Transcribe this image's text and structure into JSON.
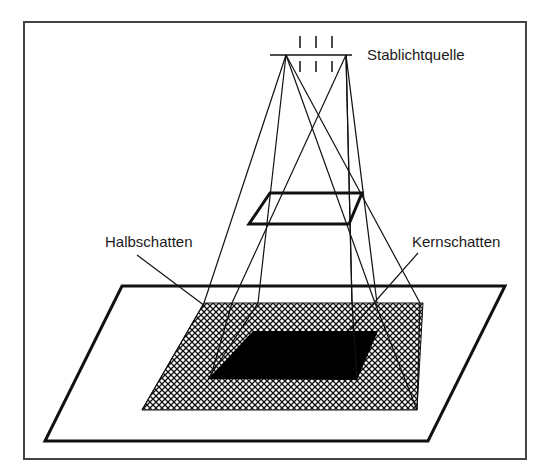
{
  "diagram": {
    "labels": {
      "light_source": "Stablichtquelle",
      "penumbra": "Halbschatten",
      "umbra": "Kernschatten"
    },
    "colors": {
      "line": "#111111",
      "frame": "#444444",
      "umbra_fill": "#000000",
      "background": "#ffffff"
    }
  }
}
